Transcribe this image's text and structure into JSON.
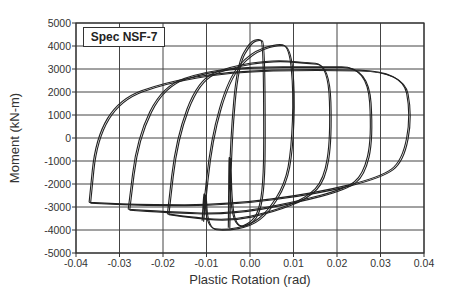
{
  "chart_data": {
    "type": "line",
    "title": "Spec  NSF-7",
    "xlabel": "Plastic Rotation (rad)",
    "ylabel": "Moment (kN-m)",
    "xlim": [
      -0.04,
      0.04
    ],
    "ylim": [
      -5000,
      5000
    ],
    "xticks": [
      "-0.04",
      "-0.03",
      "-0.02",
      "-0.01",
      "0.00",
      "0.01",
      "0.02",
      "0.03",
      "0.04"
    ],
    "yticks": [
      "5000",
      "4000",
      "3000",
      "2000",
      "1000",
      "0",
      "-1000",
      "-2000",
      "-3000",
      "-4000",
      "-5000"
    ],
    "grid": true,
    "legend": {
      "text": "Spec  NSF-7",
      "position": "top-left"
    },
    "series": [
      {
        "name": "cycle ±0.005 rad",
        "x": [
          -0.005,
          -0.0045,
          -0.003,
          0.0,
          0.002,
          0.003,
          0.0032,
          0.003,
          0.002,
          0.0,
          -0.003,
          -0.0045,
          -0.0048,
          -0.005
        ],
        "y": [
          -3900,
          0,
          3200,
          4200,
          4300,
          4200,
          0,
          -2000,
          -3200,
          -3700,
          -3900,
          -3000,
          0,
          -3900
        ]
      },
      {
        "name": "cycle ±0.01 rad",
        "x": [
          -0.011,
          -0.009,
          -0.005,
          0.0,
          0.006,
          0.009,
          0.01,
          0.0095,
          0.008,
          0.004,
          0.0,
          -0.006,
          -0.01,
          -0.0105,
          -0.011
        ],
        "y": [
          -3600,
          0,
          2600,
          3700,
          4100,
          4000,
          2000,
          -500,
          -2000,
          -3200,
          -3800,
          -4000,
          -3900,
          -2000,
          -3600
        ]
      },
      {
        "name": "cycle ±0.02 rad",
        "x": [
          -0.019,
          -0.017,
          -0.012,
          -0.005,
          0.005,
          0.012,
          0.018,
          0.0185,
          0.017,
          0.013,
          0.005,
          -0.005,
          -0.015,
          -0.019
        ],
        "y": [
          -3300,
          0,
          2500,
          3100,
          3400,
          3300,
          3200,
          0,
          -1800,
          -2600,
          -3200,
          -3600,
          -3400,
          -3300
        ]
      },
      {
        "name": "cycle ±0.03 rad",
        "x": [
          -0.028,
          -0.026,
          -0.02,
          -0.01,
          0.0,
          0.015,
          0.027,
          0.028,
          0.026,
          0.022,
          0.01,
          -0.005,
          -0.02,
          -0.028
        ],
        "y": [
          -3100,
          0,
          2300,
          2900,
          3100,
          3100,
          3100,
          0,
          -1600,
          -2200,
          -2800,
          -3300,
          -3200,
          -3100
        ]
      },
      {
        "name": "cycle ±0.037 rad",
        "x": [
          -0.037,
          -0.0355,
          -0.03,
          -0.02,
          -0.005,
          0.015,
          0.035,
          0.037,
          0.035,
          0.03,
          0.015,
          -0.005,
          -0.025,
          -0.037
        ],
        "y": [
          -2800,
          0,
          1700,
          2400,
          2900,
          3000,
          2900,
          1000,
          -1000,
          -1700,
          -2400,
          -2900,
          -2900,
          -2800
        ]
      }
    ]
  }
}
